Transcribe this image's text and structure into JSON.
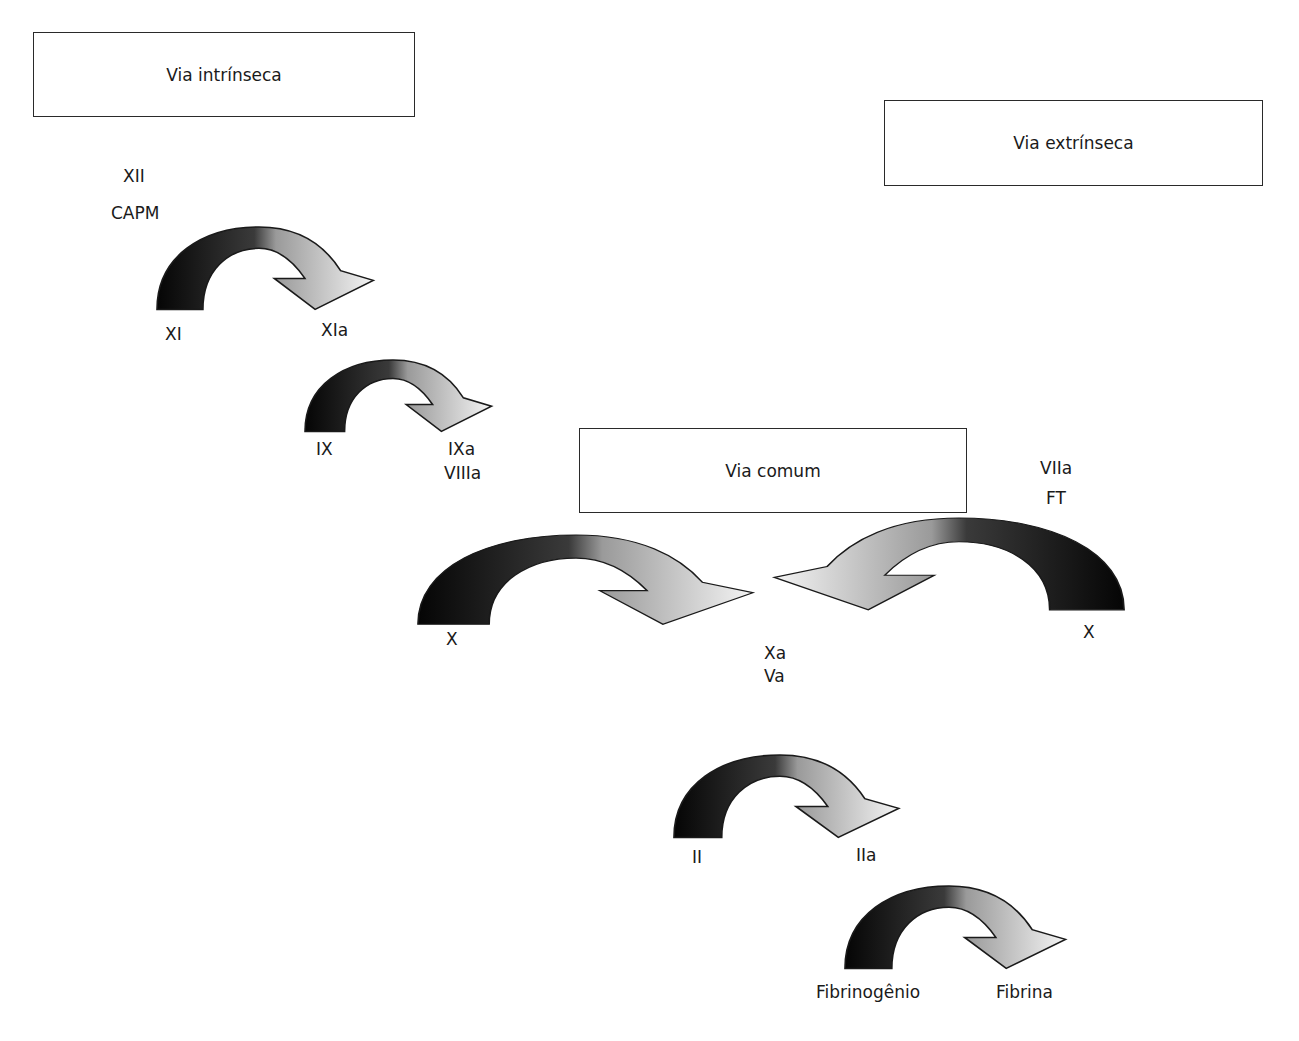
{
  "title_boxes": {
    "intrinsic": "Via intrínseca",
    "extrinsic": "Via extrínseca",
    "common": "Via comum"
  },
  "labels": {
    "xii": "XII",
    "capm": "CAPM",
    "xi": "XI",
    "xia": "XIa",
    "ix": "IX",
    "ixa": "IXa",
    "viiia": "VIIIa",
    "viia": "VIIa",
    "ft": "FT",
    "x_left": "X",
    "x_right": "X",
    "xa": "Xa",
    "va": "Va",
    "ii": "II",
    "iia": "IIa",
    "fibrinogen": "Fibrinogênio",
    "fibrin": "Fibrina"
  },
  "colors": {
    "dark": "#111111",
    "light": "#f2f2f2",
    "stroke": "#1a1a1a"
  }
}
